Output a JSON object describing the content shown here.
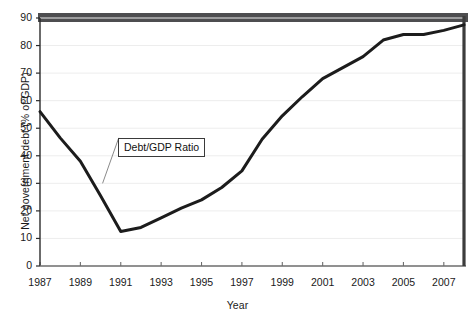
{
  "chart_data": {
    "type": "line",
    "title": "",
    "xlabel": "Year",
    "ylabel": "Net government debt (% of GDP)",
    "xlim": [
      1987,
      2008
    ],
    "ylim": [
      0,
      90
    ],
    "yticks": [
      0,
      10,
      20,
      30,
      40,
      50,
      60,
      70,
      80,
      90
    ],
    "xticks": [
      1987,
      1989,
      1991,
      1993,
      1995,
      1997,
      1999,
      2001,
      2003,
      2005,
      2007
    ],
    "xtick_labels": [
      "1987",
      "1989",
      "1991",
      "1993",
      "1995",
      "1997",
      "1999",
      "2001",
      "2003",
      "2005",
      "2007"
    ],
    "ytick_labels": [
      "0",
      "10",
      "20",
      "30",
      "40",
      "50",
      "60",
      "70",
      "80",
      "90"
    ],
    "minor_xticks": [
      1988,
      1990,
      1992,
      1994,
      1996,
      1998,
      2000,
      2002,
      2004,
      2006,
      2008
    ],
    "grid": "horizontal",
    "legend": "none",
    "series": [
      {
        "name": "Debt/GDP Ratio",
        "color": "#1c1c1c",
        "x": [
          1987,
          1988,
          1989,
          1990,
          1991,
          1992,
          1993,
          1994,
          1995,
          1996,
          1997,
          1998,
          1999,
          2000,
          2001,
          2002,
          2003,
          2004,
          2005,
          2006,
          2007,
          2008
        ],
        "values": [
          56.0,
          46.5,
          38.0,
          25.5,
          12.5,
          14.0,
          17.5,
          21.0,
          24.0,
          28.5,
          34.5,
          46.0,
          54.5,
          61.5,
          68.0,
          72.0,
          76.0,
          82.0,
          84.0,
          84.0,
          85.5,
          87.5
        ]
      }
    ],
    "annotations": [
      {
        "text": "Debt/GDP Ratio",
        "anchor_x": 1990.1,
        "anchor_y": 30.0,
        "box_x": 1990.9,
        "box_y": 46.5
      }
    ]
  }
}
